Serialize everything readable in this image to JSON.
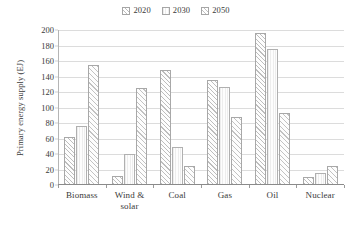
{
  "chart_data": {
    "type": "bar",
    "title": "",
    "subtitle": "",
    "xlabel": "",
    "ylabel": "Primary energy supply (EJ)",
    "categories": [
      "Biomass",
      "Wind & solar",
      "Coal",
      "Gas",
      "Oil",
      "Nuclear"
    ],
    "series": [
      {
        "name": "2020",
        "values": [
          62,
          11,
          148,
          135,
          196,
          10
        ]
      },
      {
        "name": "2030",
        "values": [
          76,
          40,
          49,
          127,
          175,
          15
        ]
      },
      {
        "name": "2050",
        "values": [
          155,
          125,
          24,
          88,
          93,
          24
        ]
      }
    ],
    "ylim": [
      0,
      200
    ],
    "ytick_values": [
      0,
      20,
      40,
      60,
      80,
      100,
      120,
      140,
      160,
      180,
      200
    ],
    "ytick_labels": [
      "0",
      "20",
      "40",
      "60",
      "80",
      "100",
      "120",
      "140",
      "160",
      "180",
      "200"
    ],
    "grid": "horizontal",
    "legend_position": "top-center",
    "legend": [
      {
        "label": "2020",
        "pattern": "diagonal-hatch",
        "color": "#bdbdbd"
      },
      {
        "label": "2030",
        "pattern": "light-fill",
        "color": "#ededed"
      },
      {
        "label": "2050",
        "pattern": "diagonal-hatch",
        "color": "#c2c2c2"
      }
    ],
    "annotations": []
  }
}
